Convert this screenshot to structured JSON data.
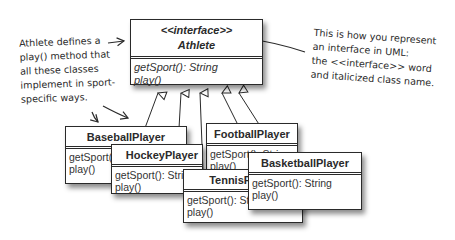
{
  "diagram": {
    "type": "UML class diagram",
    "interface": {
      "stereotype": "<<interface>>",
      "name": "Athlete",
      "methods": [
        "getSport(): String",
        "play()"
      ]
    },
    "classes": [
      {
        "name": "BaseballPlayer",
        "methods": [
          "getSport(): String",
          "play()"
        ]
      },
      {
        "name": "HockeyPlayer",
        "methods": [
          "getSport(): String",
          "play()"
        ]
      },
      {
        "name": "FootballPlayer",
        "methods": [
          "getSport(): String",
          "play()"
        ]
      },
      {
        "name": "TennisPlayer",
        "methods": [
          "getSport(): String",
          "play()"
        ]
      },
      {
        "name": "BasketballPlayer",
        "methods": [
          "getSport(): String",
          "play()"
        ]
      }
    ],
    "relationship": "realization (implements) arrows from each class to Athlete"
  },
  "annotations": {
    "left": [
      "Athlete defines a",
      "play() method that",
      "all these classes",
      "implement in sport-",
      "specific ways."
    ],
    "right": [
      "This is how you represent",
      "an interface in UML:",
      "the <<interface>> word",
      "and italicized class name."
    ]
  },
  "colors": {
    "ink": "#2a2a2a",
    "background": "#ffffff"
  }
}
